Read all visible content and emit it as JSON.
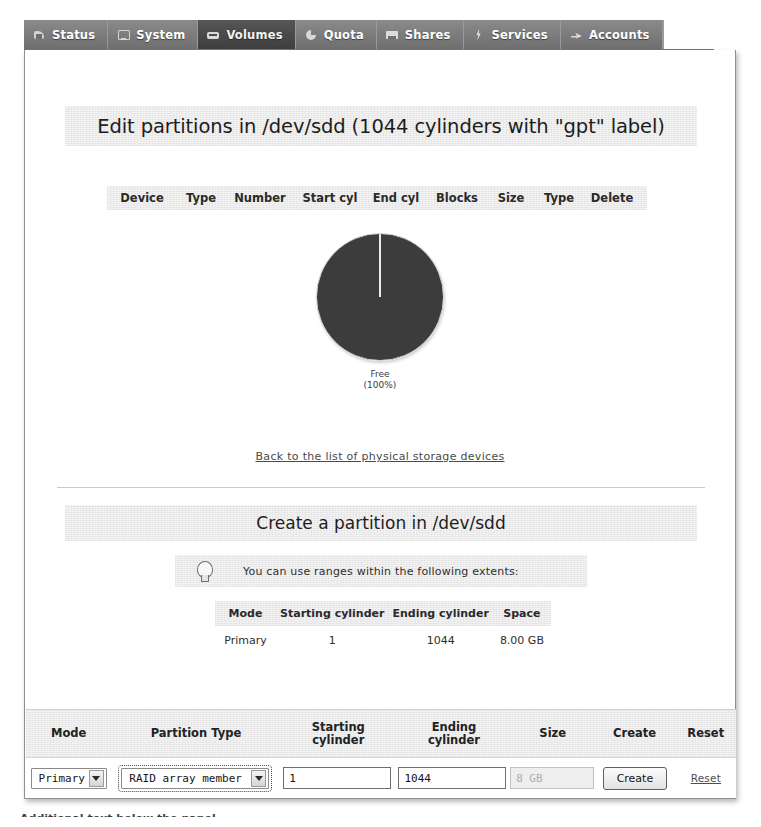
{
  "tabs": [
    {
      "label": "Status",
      "icon": "status-icon",
      "active": false
    },
    {
      "label": "System",
      "icon": "monitor-icon",
      "active": false
    },
    {
      "label": "Volumes",
      "icon": "drive-icon",
      "active": true
    },
    {
      "label": "Quota",
      "icon": "pie-icon",
      "active": false
    },
    {
      "label": "Shares",
      "icon": "folder-icon",
      "active": false
    },
    {
      "label": "Services",
      "icon": "bolt-icon",
      "active": false
    },
    {
      "label": "Accounts",
      "icon": "arrow-icon",
      "active": false
    }
  ],
  "page": {
    "title": "Edit partitions in /dev/sdd (1044 cylinders with \"gpt\" label)",
    "back_link": "Back to the list of physical storage devices",
    "section_title": "Create a partition in /dev/sdd",
    "undertext": "Additional text below the panel"
  },
  "partition_table": {
    "headers": [
      "Device",
      "Type",
      "Number",
      "Start cyl",
      "End cyl",
      "Blocks",
      "Size",
      "Type",
      "Delete"
    ],
    "rows": []
  },
  "chart_data": {
    "type": "pie",
    "title": "",
    "categories": [
      "Free"
    ],
    "values": [
      100
    ],
    "labels": [
      "Free",
      "(100%)"
    ],
    "unit": "%",
    "colors": [
      "#3c3c3c"
    ],
    "legend": "below",
    "grid": false
  },
  "hint": {
    "icon": "lightbulb-icon",
    "text": "You can use ranges within the following extents:"
  },
  "extents": {
    "headers": [
      "Mode",
      "Starting cylinder",
      "Ending cylinder",
      "Space"
    ],
    "rows": [
      {
        "mode": "Primary",
        "start": "1",
        "end": "1044",
        "space": "8.00 GB"
      }
    ]
  },
  "create_form": {
    "headers": {
      "mode": "Mode",
      "partition_type": "Partition Type",
      "starting_line1": "Starting",
      "starting_line2": "cylinder",
      "ending_line1": "Ending",
      "ending_line2": "cylinder",
      "size": "Size",
      "create": "Create",
      "reset": "Reset"
    },
    "mode_value": "Primary",
    "partition_type_value": "RAID array member",
    "starting_cylinder_value": "1",
    "ending_cylinder_value": "1044",
    "size_value": "8 GB",
    "create_label": "Create",
    "reset_label": "Reset"
  }
}
